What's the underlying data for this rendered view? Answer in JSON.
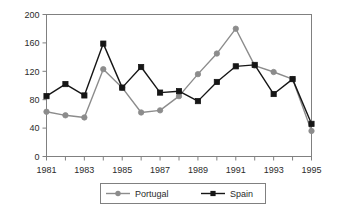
{
  "chart_data": {
    "type": "line",
    "title": "",
    "subtitle": "",
    "xlabel": "",
    "ylabel": "",
    "x": [
      1981,
      1982,
      1983,
      1984,
      1985,
      1986,
      1987,
      1988,
      1989,
      1990,
      1991,
      1992,
      1993,
      1994,
      1995
    ],
    "categories": [
      "1981",
      "1982",
      "1983",
      "1984",
      "1985",
      "1986",
      "1987",
      "1988",
      "1989",
      "1990",
      "1991",
      "1992",
      "1993",
      "1994",
      "1995"
    ],
    "xtick_labels": [
      "1981",
      "1983",
      "1985",
      "1987",
      "1989",
      "1991",
      "1993",
      "1995"
    ],
    "xtick_values": [
      1981,
      1983,
      1985,
      1987,
      1989,
      1991,
      1993,
      1995
    ],
    "xlim": [
      1981,
      1995
    ],
    "ylim": [
      0,
      200
    ],
    "ytick_labels": [
      "0",
      "40",
      "80",
      "120",
      "160",
      "200"
    ],
    "ytick_values": [
      0,
      40,
      80,
      120,
      160,
      200
    ],
    "grid": false,
    "legend_position": "bottom",
    "series": [
      {
        "name": "Portugal",
        "color": "#8c8c8c",
        "marker": "circle",
        "values": [
          63,
          58,
          55,
          123,
          97,
          62,
          65,
          85,
          116,
          145,
          180,
          128,
          119,
          109,
          36
        ]
      },
      {
        "name": "Spain",
        "color": "#161616",
        "marker": "square",
        "values": [
          85,
          102,
          86,
          159,
          97,
          126,
          90,
          92,
          78,
          105,
          127,
          129,
          88,
          109,
          46
        ]
      }
    ]
  },
  "legend": {
    "items": [
      {
        "label": "Portugal",
        "color": "#8c8c8c",
        "marker": "circle"
      },
      {
        "label": "Spain",
        "color": "#161616",
        "marker": "square"
      }
    ]
  },
  "axes": {
    "frame_color": "#808080",
    "tick_color": "#808080",
    "text_color": "#2b2b2b"
  }
}
